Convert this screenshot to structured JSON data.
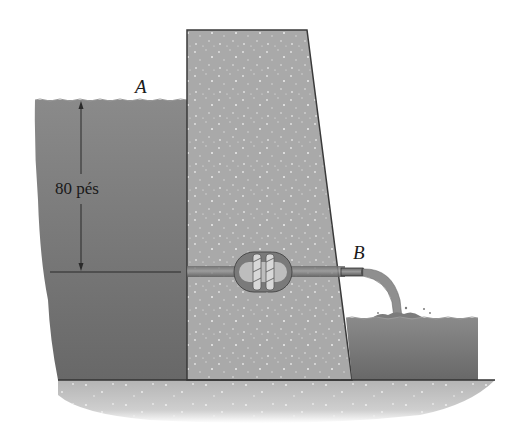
{
  "figure": {
    "point_a_label": "A",
    "point_b_label": "B",
    "height_dimension_label": "80 pés",
    "elements": [
      "upper-reservoir",
      "dam",
      "penstock-pipe",
      "turbine",
      "outlet-pipe",
      "tailwater-reservoir",
      "ground"
    ]
  },
  "colors": {
    "water": "#6e6e6e",
    "water_light": "#8a8a8a",
    "concrete": "#a9a9a9",
    "ground": "#bdbdbd",
    "outline": "#3a3a3a"
  }
}
